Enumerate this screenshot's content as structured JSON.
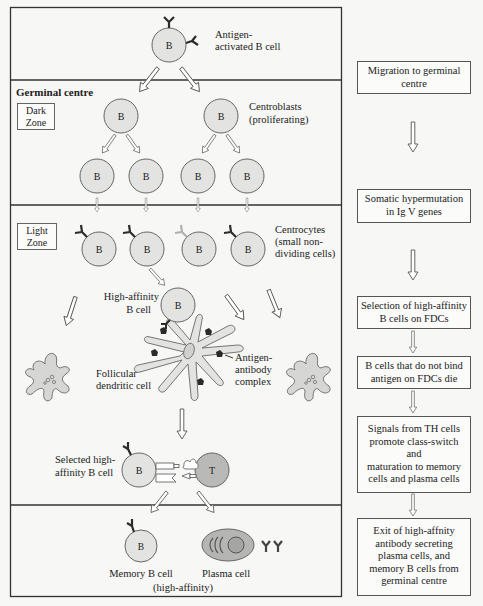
{
  "diagram": {
    "top_region": {
      "cell_label": "B",
      "caption": [
        "Antigen-",
        "activated B cell"
      ]
    },
    "germinal_centre_label": "Germinal centre",
    "dark_zone": {
      "zone_label": [
        "Dark",
        "Zone"
      ],
      "centroblast_caption": [
        "Centroblasts",
        "(proliferating)"
      ],
      "cell_label": "B"
    },
    "light_zone": {
      "zone_label": [
        "Light",
        "Zone"
      ],
      "centrocyte_caption": [
        "Centrocytes",
        "(small non-",
        "dividing cells)"
      ],
      "high_affinity_caption": [
        "High-affinity",
        "B cell"
      ],
      "fdc_caption": [
        "Follicular",
        "dendritic cell"
      ],
      "complex_caption": [
        "Antigen-",
        "antibody",
        "complex"
      ],
      "selected_caption": [
        "Selected high-",
        "affinity B cell"
      ],
      "t_cell_label": "T",
      "cell_label": "B"
    },
    "exit_region": {
      "memory_caption": "Memory B cell",
      "plasma_caption": "Plasma cell",
      "affinity_caption": "(high-affinity)",
      "cell_label": "B"
    },
    "colors": {
      "cell_fill": "#e3e3e1",
      "cell_stroke": "#666666",
      "t_cell_fill": "#b9b9b7",
      "plasma_fill": "#b5b5b3",
      "antibody": "#2b2b2b",
      "antibody_light": "#b0b0b0",
      "frame": "#333333"
    }
  },
  "steps": [
    {
      "lines": [
        "Migration to germinal",
        "centre"
      ]
    },
    {
      "lines": [
        "Somatic hypermutation",
        "in Ig V genes"
      ]
    },
    {
      "lines": [
        "Selection of high-affinity",
        "B cells on FDCs"
      ]
    },
    {
      "lines": [
        "B cells that do not bind",
        "antigen on FDCs die"
      ]
    },
    {
      "lines": [
        "Signals from TH cells",
        "promote class-switch and",
        "maturation to memory",
        "cells and plasma cells"
      ]
    },
    {
      "lines": [
        "Exit of high-affnity",
        "antibody secreting",
        "plasma cells, and",
        "memory B cells from",
        "germinal centre"
      ]
    }
  ]
}
